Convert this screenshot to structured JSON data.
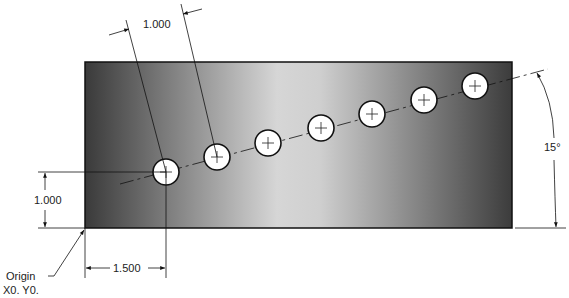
{
  "drawing": {
    "type": "engineering-drawing",
    "subject": "Plate with bolt-circle holes on 15° line",
    "dimensions": {
      "hole_spacing": "1.000",
      "first_hole_y": "1.000",
      "first_hole_x": "1.500",
      "angle": "15°"
    },
    "origin_label": {
      "line1": "Origin",
      "line2": "X0. Y0."
    },
    "hole_count": 7,
    "colors": {
      "plate_dark": "#3a3a3a",
      "plate_light": "#d8d8d8",
      "hole_fill": "#ffffff",
      "line": "#111111"
    }
  }
}
